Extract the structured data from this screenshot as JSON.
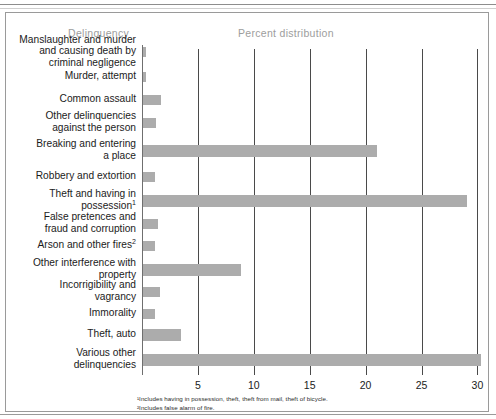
{
  "headers": {
    "category_column": "Delinquency",
    "value_column": "Percent distribution"
  },
  "footnotes": {
    "note_1": "¹Includes having in possession, theft, theft from mail, theft of bicycle.",
    "note_2": "²Includes false alarm of fire."
  },
  "colors": {
    "bar_fill": "#acacac",
    "frame": "#9a9a9a",
    "gridline": "#4a4a4a",
    "header_text": "#9d9d9d",
    "label_text": "#1b1b1b"
  },
  "chart_data": {
    "type": "bar",
    "orientation": "horizontal",
    "title": "",
    "xlabel": "Percent distribution",
    "ylabel": "Delinquency",
    "xlim": [
      0,
      31
    ],
    "xticks": [
      5,
      10,
      15,
      20,
      25,
      30
    ],
    "xtick_labels": [
      "5",
      "10",
      "15",
      "20",
      "25",
      "30"
    ],
    "grid": true,
    "legend": false,
    "categories": [
      "Manslaughter and murder\nand causing death by\ncriminal negligence",
      "Murder, attempt",
      "Common assault",
      "Other delinquencies\nagainst the person",
      "Breaking and entering\na place",
      "Robbery and extortion",
      "Theft and having in\npossession",
      "False pretences and\nfraud and corruption",
      "Arson and other fires",
      "Other interference with\nproperty",
      "Incorrigibility and\nvagrancy",
      "Immorality",
      "Theft, auto",
      "Various other\ndelinquencies"
    ],
    "category_footnote_marks": [
      "",
      "",
      "",
      "",
      "",
      "",
      "1",
      "",
      "2",
      "",
      "",
      "",
      "",
      ""
    ],
    "values": [
      0.3,
      0.3,
      1.6,
      1.2,
      20.9,
      1.1,
      29.0,
      1.3,
      1.1,
      8.8,
      1.5,
      1.1,
      3.4,
      30.2
    ]
  }
}
